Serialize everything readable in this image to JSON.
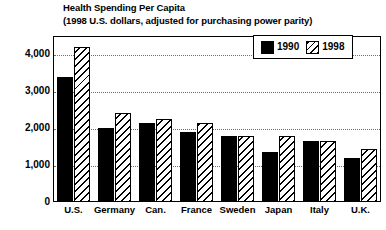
{
  "chart_data": {
    "type": "bar",
    "title": "Health Spending Per Capita",
    "subtitle": "(1998 U.S. dollars, adjusted for purchasing power parity)",
    "xlabel": "",
    "ylabel": "",
    "ylim": [
      0,
      4500
    ],
    "grid": true,
    "grid_axis": "y",
    "legend_position": "top-right",
    "categories": [
      "U.S.",
      "Germany",
      "Can.",
      "France",
      "Sweden",
      "Japan",
      "Italy",
      "U.K."
    ],
    "ytick_labels": [
      "0",
      "1,000",
      "2,000",
      "3,000",
      "4,000"
    ],
    "ytick_values": [
      0,
      1000,
      2000,
      3000,
      4000
    ],
    "series": [
      {
        "name": "1990",
        "fill": "solid-black",
        "color": "#000000",
        "values": [
          3400,
          2000,
          2150,
          1900,
          1800,
          1350,
          1650,
          1200
        ]
      },
      {
        "name": "1998",
        "fill": "diagonal-hatch",
        "color": "#ffffff",
        "values": [
          4200,
          2400,
          2250,
          2150,
          1800,
          1800,
          1650,
          1450
        ]
      }
    ]
  },
  "legend": {
    "entries": [
      {
        "label": "1990",
        "swatch": "solid"
      },
      {
        "label": "1998",
        "swatch": "hatch"
      }
    ]
  },
  "colors": {
    "series_1990": "#000000",
    "series_1998": "#ffffff",
    "axis": "#000000",
    "gridline": "#6e6e6e",
    "background": "#ffffff"
  }
}
